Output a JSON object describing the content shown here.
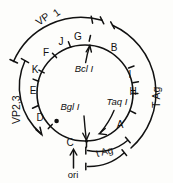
{
  "diagram": {
    "type": "circular-genome-map",
    "center": {
      "x": 85,
      "y": 93
    },
    "inner_radius": 48,
    "outer_radius": 74,
    "stroke_color": "#111111"
  },
  "fragments": {
    "caption": "restriction fragments on inner circle",
    "items": [
      {
        "id": "G",
        "label": "G",
        "x": 78,
        "y": 40,
        "angle_deg": 275
      },
      {
        "id": "J",
        "label": "J",
        "x": 61,
        "y": 43,
        "angle_deg": 258
      },
      {
        "id": "F",
        "label": "F",
        "x": 47,
        "y": 52,
        "angle_deg": 243
      },
      {
        "id": "K",
        "label": "K",
        "x": 34,
        "y": 69,
        "angle_deg": 222
      },
      {
        "id": "E",
        "label": "E",
        "x": 31,
        "y": 90,
        "angle_deg": 200
      },
      {
        "id": "D",
        "label": "D",
        "x": 38,
        "y": 119,
        "angle_deg": 160
      },
      {
        "id": "C",
        "label": "C",
        "x": 69,
        "y": 144,
        "angle_deg": 100
      },
      {
        "id": "A",
        "label": "A",
        "x": 120,
        "y": 126,
        "angle_deg": 48
      },
      {
        "id": "H",
        "label": "H",
        "x": 132,
        "y": 91,
        "angle_deg": 5
      },
      {
        "id": "I",
        "label": "I",
        "x": 130,
        "y": 74,
        "angle_deg": 350
      },
      {
        "id": "B",
        "label": "B",
        "x": 114,
        "y": 48,
        "angle_deg": 318
      }
    ]
  },
  "enzymes": {
    "caption": "restriction enzyme cut sites",
    "items": [
      {
        "id": "bcl-i",
        "label": "Bcl I",
        "x": 84,
        "y": 69
      },
      {
        "id": "bgl-i",
        "label": "Bgl I",
        "x": 70,
        "y": 110
      },
      {
        "id": "taq-i",
        "label": "Taq I",
        "x": 115,
        "y": 104
      }
    ]
  },
  "genes": {
    "caption": "coding regions shown as external arcs",
    "vp1": "VP",
    "vp1_sub": "1",
    "vp23": "VP2,3",
    "t_ag": "T Ag",
    "t_ag_small": "t Ag",
    "ori": "ori"
  },
  "colors": {
    "ink": "#111111",
    "paper": "#fdfdfb"
  }
}
